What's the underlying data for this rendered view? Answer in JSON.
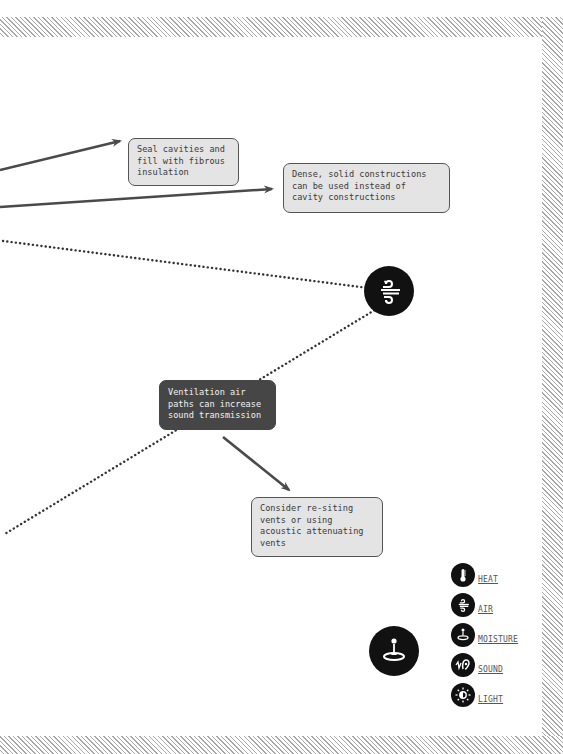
{
  "diagram": {
    "notes": {
      "seal_cavities": "Seal cavities and\nfill with fibrous\ninsulation",
      "dense_solid": "Dense, solid constructions\ncan be used instead of\ncavity constructions",
      "ventilation": "Ventilation air\npaths can increase\nsound transmission",
      "resite_vents": "Consider re-siting\nvents or using\nacoustic attenuating\nvents"
    },
    "nodes": [
      {
        "id": "air",
        "icon": "air-icon"
      },
      {
        "id": "moisture",
        "icon": "moisture-icon"
      }
    ],
    "colors": {
      "line": "#4a4a4a",
      "note_bg": "#e4e4e4",
      "dark_note_bg": "#464646",
      "icon_bg": "#111111",
      "hatch": "#a8a8a8"
    }
  },
  "legend": {
    "items": [
      {
        "label": "HEAT",
        "icon": "heat-icon"
      },
      {
        "label": "AIR",
        "icon": "air-icon"
      },
      {
        "label": "MOISTURE",
        "icon": "moisture-icon"
      },
      {
        "label": "SOUND",
        "icon": "sound-icon"
      },
      {
        "label": "LIGHT",
        "icon": "light-icon"
      }
    ]
  }
}
